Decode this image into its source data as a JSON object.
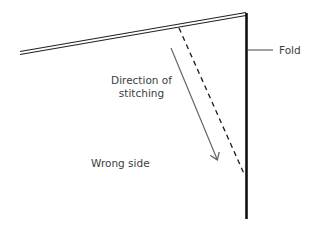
{
  "diagram": {
    "type": "sewing-seam-diagram",
    "labels": {
      "fold": "Fold",
      "direction_line1": "Direction of",
      "direction_line2": "stitching",
      "wrong_side": "Wrong side"
    },
    "colors": {
      "fold_line": "#111111",
      "fabric_edge": "#222222",
      "stitch_line": "#1a1a1a",
      "arrow": "#666666",
      "text": "#3d3d3d",
      "background": "#ffffff"
    },
    "elements": {
      "fabric_edge": {
        "x1": 20,
        "y1": 53,
        "x2": 246,
        "y2": 14
      },
      "fold_line": {
        "x1": 246,
        "y1": 13,
        "x2": 246,
        "y2": 219
      },
      "fold_leader": {
        "x1": 248,
        "y1": 50,
        "x2": 273,
        "y2": 50
      },
      "stitch_line": {
        "x1": 179,
        "y1": 28,
        "x2": 245,
        "y2": 176
      },
      "direction_arrow": {
        "x1": 171,
        "y1": 48,
        "x2": 217,
        "y2": 159
      }
    }
  }
}
